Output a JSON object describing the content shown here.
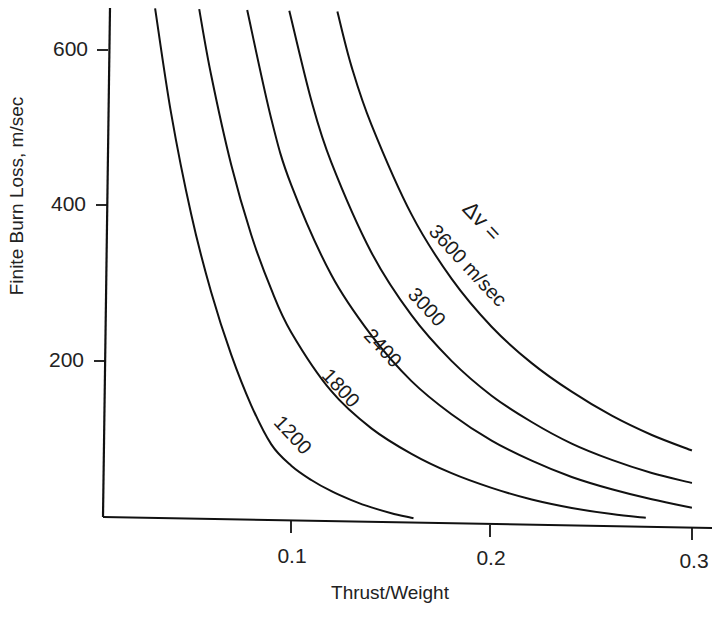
{
  "chart_data": {
    "type": "line",
    "title": "",
    "xlabel": "Thrust/Weight",
    "ylabel": "Finite Burn Loss, m/sec",
    "xlim": [
      0.0,
      0.3
    ],
    "ylim": [
      0,
      600
    ],
    "grid": false,
    "xticks": [
      "0.1",
      "0.2",
      "0.3"
    ],
    "yticks": [
      "200",
      "400",
      "600"
    ],
    "legend_title": "Δv =",
    "legend_unit": "m/sec",
    "legend_position": "inline labels along curves",
    "data_note": "Curve coordinates are approximated from a smooth shape-fitting model anchored to the visible curve endpoints and axis ticks, not digitized point-by-point from the image.",
    "series": [
      {
        "name": "1200",
        "label": "1200",
        "x": [
          0.032,
          0.04,
          0.05,
          0.06,
          0.07,
          0.08,
          0.09,
          0.1,
          0.11,
          0.12,
          0.13,
          0.14,
          0.15,
          0.161
        ],
        "y": [
          655,
          520,
          390,
          290,
          210,
          145,
          95,
          68,
          50,
          36,
          25,
          16,
          9,
          3
        ]
      },
      {
        "name": "1800",
        "label": "1800",
        "x": [
          0.054,
          0.06,
          0.07,
          0.08,
          0.09,
          0.1,
          0.12,
          0.14,
          0.16,
          0.18,
          0.2,
          0.22,
          0.24,
          0.26,
          0.277
        ],
        "y": [
          655,
          570,
          455,
          365,
          295,
          240,
          165,
          118,
          86,
          62,
          44,
          30,
          20,
          13,
          9
        ]
      },
      {
        "name": "2400",
        "label": "2400",
        "x": [
          0.078,
          0.09,
          0.1,
          0.12,
          0.14,
          0.16,
          0.18,
          0.2,
          0.22,
          0.24,
          0.26,
          0.28,
          0.3
        ],
        "y": [
          655,
          515,
          430,
          315,
          238,
          180,
          138,
          105,
          80,
          60,
          45,
          33,
          23
        ]
      },
      {
        "name": "3000",
        "label": "3000",
        "x": [
          0.099,
          0.11,
          0.12,
          0.14,
          0.16,
          0.18,
          0.2,
          0.22,
          0.24,
          0.26,
          0.28,
          0.3
        ],
        "y": [
          655,
          540,
          460,
          345,
          265,
          207,
          163,
          130,
          103,
          83,
          67,
          55
        ]
      },
      {
        "name": "3600",
        "label": "3600",
        "x": [
          0.123,
          0.13,
          0.14,
          0.16,
          0.18,
          0.2,
          0.22,
          0.24,
          0.26,
          0.28,
          0.3
        ],
        "y": [
          655,
          585,
          510,
          395,
          313,
          252,
          206,
          170,
          140,
          116,
          97
        ]
      }
    ]
  },
  "labels": {
    "ytick_600": "600",
    "ytick_400": "400",
    "ytick_200": "200",
    "xtick_01": "0.1",
    "xtick_02": "0.2",
    "xtick_03": "0.3",
    "xaxis_title": "Thrust/Weight",
    "yaxis_title": "Finite Burn Loss, m/sec",
    "dv_prefix": "Δv =",
    "label_3600": "3600 m/sec",
    "label_3000": "3000",
    "label_2400": "2400",
    "label_1800": "1800",
    "label_1200": "1200"
  }
}
